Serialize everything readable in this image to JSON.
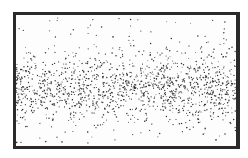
{
  "figure": {
    "frame_color": "#2a2a2a",
    "dot_color": "#333333",
    "band_center_fraction": 0.55,
    "dot_count": 1400
  }
}
